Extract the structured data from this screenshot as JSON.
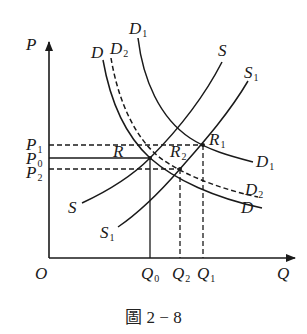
{
  "figure": {
    "caption": "圖 2 − 8",
    "axes": {
      "y_label": "P",
      "x_label": "Q",
      "origin_label": "O"
    },
    "price_levels": [
      {
        "id": "P1",
        "base": "P",
        "sub": "1",
        "style": "dashed"
      },
      {
        "id": "P0",
        "base": "P",
        "sub": "0",
        "style": "solid"
      },
      {
        "id": "P2",
        "base": "P",
        "sub": "2",
        "style": "dashed"
      }
    ],
    "quantity_levels": [
      {
        "id": "Q0",
        "base": "Q",
        "sub": "0",
        "style": "solid"
      },
      {
        "id": "Q2",
        "base": "Q",
        "sub": "2",
        "style": "dashed"
      },
      {
        "id": "Q1",
        "base": "Q",
        "sub": "1",
        "style": "dashed"
      }
    ],
    "curves": {
      "D": {
        "top_label": "D",
        "bottom_label": "D",
        "style": "solid",
        "type": "demand"
      },
      "D1": {
        "top_label_base": "D",
        "top_label_sub": "1",
        "bottom_label_base": "D",
        "bottom_label_sub": "1",
        "style": "solid",
        "type": "demand"
      },
      "D2": {
        "top_label_base": "D",
        "top_label_sub": "2",
        "bottom_label_base": "D",
        "bottom_label_sub": "2",
        "style": "dashed",
        "type": "demand"
      },
      "S": {
        "top_label": "S",
        "bottom_label": "S",
        "style": "solid",
        "type": "supply"
      },
      "S1": {
        "top_label_base": "S",
        "top_label_sub": "1",
        "bottom_label_base": "S",
        "bottom_label_sub": "1",
        "style": "solid",
        "type": "supply"
      }
    },
    "equilibrium_points": [
      {
        "id": "R",
        "label": "R",
        "sub": "",
        "price": "P0",
        "quantity": "Q0",
        "curves": [
          "D",
          "S"
        ]
      },
      {
        "id": "R1",
        "label": "R",
        "sub": "1",
        "price": "P1",
        "quantity": "Q1",
        "curves": [
          "D1",
          "S1"
        ]
      },
      {
        "id": "R2",
        "label": "R",
        "sub": "2",
        "price": "P2",
        "quantity": "Q2",
        "curves": [
          "D2",
          "S1"
        ]
      }
    ],
    "colors": {
      "ink": "#1a1a1a",
      "background": "#ffffff"
    }
  }
}
